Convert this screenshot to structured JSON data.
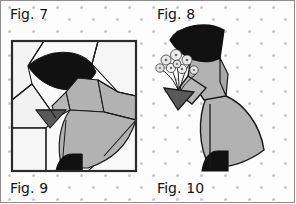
{
  "figure": {
    "kind": "quilt-pattern-diagram",
    "background": {
      "color": "#fdfdfd",
      "dot_color": "#c8c8cc",
      "dot_pattern": "staggered grid",
      "dot_spacing_px": 24,
      "dot_radius_px": 1.5
    },
    "border_color": "#8e8e92"
  },
  "labels": {
    "top_left": "Fig. 7",
    "top_right": "Fig. 8",
    "bottom_left": "Fig. 9",
    "bottom_right": "Fig. 10"
  },
  "palette": {
    "black": "#111111",
    "dark_gray": "#595959",
    "mid_gray": "#b2b2b2",
    "light_gray": "#ededed",
    "off_white": "#f7f7f7",
    "white": "#ffffff",
    "outline": "#1a1a1a",
    "frame": "#2b2b2b"
  },
  "left_figure": {
    "name": "pieced-block-with-seam-lines",
    "description": "Square quilt block showing the Sunbonnet Sue figure divided into pieced patches by seam lines",
    "frame": {
      "x": 11,
      "y": 40,
      "width": 126,
      "height": 132
    },
    "parts": [
      {
        "name": "bonnet",
        "fill": "black"
      },
      {
        "name": "bonnet-brim-under",
        "fill": "off_white"
      },
      {
        "name": "neck-bodice",
        "fill": "mid_gray"
      },
      {
        "name": "sleeve",
        "fill": "mid_gray"
      },
      {
        "name": "hand-mitt",
        "fill": "dark_gray"
      },
      {
        "name": "skirt",
        "fill": "mid_gray"
      },
      {
        "name": "shoe",
        "fill": "black"
      },
      {
        "name": "background-patches",
        "fill": "off_white"
      }
    ]
  },
  "right_figure": {
    "name": "finished-applique-figure",
    "description": "Completed Sunbonnet Sue appliqué holding a bouquet of flowers",
    "parts": [
      {
        "name": "bonnet",
        "fill": "black"
      },
      {
        "name": "bodice",
        "fill": "mid_gray"
      },
      {
        "name": "arm-sleeve",
        "fill": "mid_gray"
      },
      {
        "name": "hand-mitt",
        "fill": "dark_gray"
      },
      {
        "name": "skirt",
        "fill": "mid_gray"
      },
      {
        "name": "shoe",
        "fill": "black"
      },
      {
        "name": "bouquet-flowers",
        "fill": "light_gray"
      },
      {
        "name": "bouquet-stems",
        "fill": "outline"
      }
    ]
  }
}
